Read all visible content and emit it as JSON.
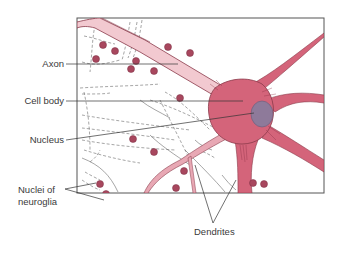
{
  "diagram": {
    "labels": [
      {
        "id": "axon",
        "text": "Axon"
      },
      {
        "id": "cell-body",
        "text": "Cell body"
      },
      {
        "id": "nucleus",
        "text": "Nucleus"
      },
      {
        "id": "nuclei-neuroglia-1",
        "text": "Nuclei of"
      },
      {
        "id": "nuclei-neuroglia-2",
        "text": "neuroglia"
      },
      {
        "id": "dendrites",
        "text": "Dendrites"
      }
    ],
    "colors": {
      "neuron_fill": "#d4647a",
      "neuron_light": "#e8a8b4",
      "axon_fill": "#f2c9d0",
      "nucleus_fill": "#8e7a9a",
      "glia_nucleus": "#a8475e",
      "frame": "#555555",
      "text": "#3a3a3a"
    }
  }
}
